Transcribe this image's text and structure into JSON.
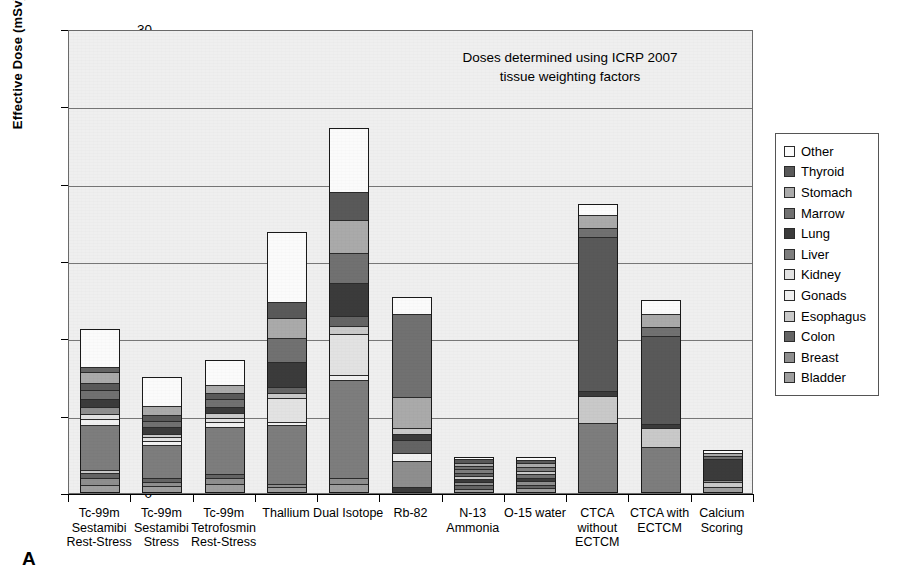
{
  "axis": {
    "ylabel": "Effective Dose (mSv)",
    "yticks": [
      "0",
      "5",
      "10",
      "15",
      "20",
      "25",
      "30"
    ]
  },
  "annotation": {
    "line1": "Doses determined using ICRP 2007",
    "line2": "tissue weighting factors"
  },
  "panel_letter": "A",
  "legend": {
    "items": [
      {
        "label": "Other",
        "color": "#fbfbfb"
      },
      {
        "label": "Thyroid",
        "color": "#595959"
      },
      {
        "label": "Stomach",
        "color": "#aaaaaa"
      },
      {
        "label": "Marrow",
        "color": "#717171"
      },
      {
        "label": "Lung",
        "color": "#3b3b3b"
      },
      {
        "label": "Liver",
        "color": "#7d7d7d"
      },
      {
        "label": "Kidney",
        "color": "#e2e2e2"
      },
      {
        "label": "Gonads",
        "color": "#f0f0f0"
      },
      {
        "label": "Esophagus",
        "color": "#c9c9c9"
      },
      {
        "label": "Colon",
        "color": "#646464"
      },
      {
        "label": "Breast",
        "color": "#8e8e8e"
      },
      {
        "label": "Bladder",
        "color": "#9e9e9e"
      }
    ]
  },
  "chart_data": {
    "type": "bar",
    "stacked": true,
    "title": "",
    "xlabel": "",
    "ylabel": "Effective Dose (mSv)",
    "ylim": [
      0,
      30
    ],
    "ytick_step": 5,
    "grid": true,
    "legend_position": "right",
    "annotation": "Doses determined using ICRP 2007 tissue weighting factors",
    "series_order_bottom_to_top": [
      "Bladder",
      "Breast",
      "Colon",
      "Esophagus",
      "Gonads",
      "Kidney",
      "Liver",
      "Lung",
      "Marrow",
      "Stomach",
      "Thyroid",
      "Other"
    ],
    "categories": [
      "Tc-99m Sestamibi Rest-Stress",
      "Tc-99m Sestamibi Stress",
      "Tc-99m Tetrofosmin Rest-Stress",
      "Thallium",
      "Dual Isotope",
      "Rb-82",
      "N-13 Ammonia",
      "O-15 water",
      "CTCA without ECTCM",
      "CTCA with ECTCM",
      "Calcium Scoring"
    ],
    "category_labels_multiline": [
      "Tc-99m\nSestamibi\nRest-Stress",
      "Tc-99m\nSestamibi\nStress",
      "Tc-99m\nTetrofosmin\nRest-Stress",
      "Thallium",
      "Dual Isotope",
      "Rb-82",
      "N-13\nAmmonia",
      "O-15 water",
      "CTCA\nwithout\nECTCM",
      "CTCA with\nECTCM",
      "Calcium\nScoring"
    ],
    "totals": [
      10.6,
      7.5,
      8.6,
      16.9,
      23.6,
      12.7,
      2.3,
      2.3,
      18.7,
      12.5,
      2.8
    ],
    "series": [
      {
        "name": "Bladder",
        "color": "#9e9e9e",
        "values": [
          0.45,
          0.35,
          0.5,
          0.25,
          0.45,
          0.0,
          0.15,
          0.15,
          0.0,
          0.0,
          0.3
        ]
      },
      {
        "name": "Breast",
        "color": "#8e8e8e",
        "values": [
          0.4,
          0.3,
          0.35,
          0.15,
          0.35,
          0.3,
          0.15,
          0.15,
          0.0,
          0.0,
          0.2
        ]
      },
      {
        "name": "Colon",
        "color": "#646464",
        "values": [
          0.3,
          0.25,
          0.3,
          0.1,
          0.3,
          0.0,
          0.2,
          0.2,
          0.0,
          0.0,
          0.0
        ]
      },
      {
        "name": "Esophagus",
        "color": "#c9c9c9",
        "values": [
          0.1,
          0.1,
          0.1,
          0.1,
          0.15,
          0.4,
          0.15,
          0.15,
          0.0,
          0.0,
          0.2
        ]
      },
      {
        "name": "Gonads",
        "color": "#f0f0f0",
        "values": [
          0.1,
          0.1,
          0.1,
          0.1,
          0.1,
          0.1,
          0.1,
          0.1,
          0.0,
          0.0,
          0.05
        ]
      },
      {
        "name": "Kidney",
        "color": "#e2e2e2",
        "values": [
          0.1,
          0.1,
          0.1,
          0.1,
          0.1,
          0.1,
          0.1,
          0.1,
          0.0,
          0.0,
          0.0
        ]
      },
      {
        "name": "Liver",
        "color": "#7d7d7d",
        "values": [
          3.2,
          2.1,
          3.3,
          3.8,
          5.8,
          0.7,
          0.3,
          0.3,
          4.5,
          2.9,
          0.0
        ]
      },
      {
        "name": "Lung",
        "color": "#3b3b3b",
        "values": [
          0.35,
          0.3,
          0.35,
          0.3,
          0.55,
          0.55,
          0.25,
          0.25,
          0.1,
          0.1,
          1.6
        ]
      },
      {
        "name": "Marrow",
        "color": "#717171",
        "values": [
          0.45,
          0.35,
          0.45,
          2.15,
          1.35,
          0.3,
          0.25,
          0.25,
          0.3,
          0.25,
          0.1
        ]
      },
      {
        "name": "Stomach",
        "color": "#aaaaaa",
        "values": [
          0.65,
          0.45,
          0.55,
          1.15,
          1.3,
          4.65,
          0.2,
          0.2,
          1.55,
          1.1,
          0.1
        ]
      },
      {
        "name": "Thyroid",
        "color": "#595959",
        "values": [
          0.8,
          0.6,
          0.7,
          1.6,
          2.15,
          0.2,
          0.25,
          0.25,
          10.45,
          6.85,
          0.0
        ]
      },
      {
        "name": "Other",
        "color": "#fbfbfb",
        "values": [
          3.7,
          2.5,
          1.8,
          7.1,
          11.0,
          5.4,
          0.3,
          0.3,
          1.8,
          1.3,
          0.25
        ]
      }
    ]
  },
  "bars": [
    {
      "name": "tc99m-sestamibi-rest-stress",
      "label": "Tc-99m\nSestamibi\nRest-Stress",
      "total": 10.6,
      "segments": [
        {
          "tissue": "Bladder",
          "value": 0.45,
          "color": "#9e9e9e"
        },
        {
          "tissue": "Breast",
          "value": 0.4,
          "color": "#8e8e8e"
        },
        {
          "tissue": "Colon",
          "value": 0.3,
          "color": "#646464"
        },
        {
          "tissue": "Esophagus",
          "value": 0.1,
          "color": "#c9c9c9"
        },
        {
          "tissue": "Liver",
          "value": 3.2,
          "color": "#7d7d7d"
        },
        {
          "tissue": "Gonads",
          "value": 0.35,
          "color": "#f0f0f0"
        },
        {
          "tissue": "Kidney",
          "value": 0.25,
          "color": "#e2e2e2"
        },
        {
          "tissue": "Breast",
          "value": 0.4,
          "color": "#8e8e8e"
        },
        {
          "tissue": "Lung",
          "value": 0.55,
          "color": "#3b3b3b"
        },
        {
          "tissue": "Marrow",
          "value": 0.55,
          "color": "#717171"
        },
        {
          "tissue": "Thyroid",
          "value": 0.45,
          "color": "#595959"
        },
        {
          "tissue": "Stomach",
          "value": 0.7,
          "color": "#aaaaaa"
        },
        {
          "tissue": "Colon",
          "value": 0.3,
          "color": "#646464"
        },
        {
          "tissue": "Other",
          "value": 2.6,
          "color": "#fbfbfb"
        }
      ]
    },
    {
      "name": "tc99m-sestamibi-stress",
      "label": "Tc-99m\nSestamibi\nStress",
      "total": 7.5,
      "segments": [
        {
          "tissue": "Bladder",
          "value": 0.35,
          "color": "#9e9e9e"
        },
        {
          "tissue": "Breast",
          "value": 0.25,
          "color": "#8e8e8e"
        },
        {
          "tissue": "Colon",
          "value": 0.2,
          "color": "#646464"
        },
        {
          "tissue": "Liver",
          "value": 2.3,
          "color": "#7d7d7d"
        },
        {
          "tissue": "Gonads",
          "value": 0.25,
          "color": "#f0f0f0"
        },
        {
          "tissue": "Kidney",
          "value": 0.2,
          "color": "#e2e2e2"
        },
        {
          "tissue": "Esophagus",
          "value": 0.2,
          "color": "#c9c9c9"
        },
        {
          "tissue": "Lung",
          "value": 0.4,
          "color": "#3b3b3b"
        },
        {
          "tissue": "Marrow",
          "value": 0.4,
          "color": "#717171"
        },
        {
          "tissue": "Thyroid",
          "value": 0.35,
          "color": "#595959"
        },
        {
          "tissue": "Stomach",
          "value": 0.55,
          "color": "#aaaaaa"
        },
        {
          "tissue": "Other",
          "value": 2.05,
          "color": "#fbfbfb"
        }
      ]
    },
    {
      "name": "tc99m-tetrofosmin-rest-stress",
      "label": "Tc-99m\nTetrofosmin\nRest-Stress",
      "total": 8.6,
      "segments": [
        {
          "tissue": "Bladder",
          "value": 0.5,
          "color": "#9e9e9e"
        },
        {
          "tissue": "Breast",
          "value": 0.35,
          "color": "#8e8e8e"
        },
        {
          "tissue": "Colon",
          "value": 0.25,
          "color": "#646464"
        },
        {
          "tissue": "Liver",
          "value": 3.3,
          "color": "#7d7d7d"
        },
        {
          "tissue": "Gonads",
          "value": 0.25,
          "color": "#f0f0f0"
        },
        {
          "tissue": "Kidney",
          "value": 0.25,
          "color": "#e2e2e2"
        },
        {
          "tissue": "Esophagus",
          "value": 0.25,
          "color": "#c9c9c9"
        },
        {
          "tissue": "Lung",
          "value": 0.4,
          "color": "#3b3b3b"
        },
        {
          "tissue": "Marrow",
          "value": 0.45,
          "color": "#717171"
        },
        {
          "tissue": "Thyroid",
          "value": 0.4,
          "color": "#595959"
        },
        {
          "tissue": "Stomach",
          "value": 0.5,
          "color": "#aaaaaa"
        },
        {
          "tissue": "Other",
          "value": 1.7,
          "color": "#fbfbfb"
        }
      ]
    },
    {
      "name": "thallium",
      "label": "Thallium",
      "total": 16.9,
      "segments": [
        {
          "tissue": "Bladder",
          "value": 0.25,
          "color": "#9e9e9e"
        },
        {
          "tissue": "Breast",
          "value": 0.15,
          "color": "#8e8e8e"
        },
        {
          "tissue": "Liver",
          "value": 3.95,
          "color": "#7d7d7d"
        },
        {
          "tissue": "Gonads",
          "value": 0.15,
          "color": "#f0f0f0"
        },
        {
          "tissue": "Kidney",
          "value": 1.55,
          "color": "#e2e2e2"
        },
        {
          "tissue": "Esophagus",
          "value": 0.3,
          "color": "#c9c9c9"
        },
        {
          "tissue": "Colon",
          "value": 0.35,
          "color": "#646464"
        },
        {
          "tissue": "Lung",
          "value": 1.6,
          "color": "#3b3b3b"
        },
        {
          "tissue": "Marrow",
          "value": 1.55,
          "color": "#717171"
        },
        {
          "tissue": "Stomach",
          "value": 1.3,
          "color": "#aaaaaa"
        },
        {
          "tissue": "Thyroid",
          "value": 1.0,
          "color": "#595959"
        },
        {
          "tissue": "Other",
          "value": 4.75,
          "color": "#fbfbfb"
        }
      ]
    },
    {
      "name": "dual-isotope",
      "label": "Dual Isotope",
      "total": 23.6,
      "segments": [
        {
          "tissue": "Bladder",
          "value": 0.45,
          "color": "#9e9e9e"
        },
        {
          "tissue": "Breast",
          "value": 0.35,
          "color": "#8e8e8e"
        },
        {
          "tissue": "Liver",
          "value": 6.5,
          "color": "#7d7d7d"
        },
        {
          "tissue": "Gonads",
          "value": 0.25,
          "color": "#f0f0f0"
        },
        {
          "tissue": "Kidney",
          "value": 2.7,
          "color": "#e2e2e2"
        },
        {
          "tissue": "Esophagus",
          "value": 0.45,
          "color": "#c9c9c9"
        },
        {
          "tissue": "Colon",
          "value": 0.65,
          "color": "#646464"
        },
        {
          "tissue": "Lung",
          "value": 2.15,
          "color": "#3b3b3b"
        },
        {
          "tissue": "Marrow",
          "value": 1.95,
          "color": "#717171"
        },
        {
          "tissue": "Stomach",
          "value": 2.15,
          "color": "#aaaaaa"
        },
        {
          "tissue": "Thyroid",
          "value": 1.75,
          "color": "#595959"
        },
        {
          "tissue": "Other",
          "value": 4.25,
          "color": "#fbfbfb"
        }
      ]
    },
    {
      "name": "rb-82",
      "label": "Rb-82",
      "total": 12.7,
      "segments": [
        {
          "tissue": "Lung",
          "value": 0.25,
          "color": "#3b3b3b"
        },
        {
          "tissue": "Breast",
          "value": 1.75,
          "color": "#8e8e8e"
        },
        {
          "tissue": "Gonads",
          "value": 0.45,
          "color": "#f0f0f0"
        },
        {
          "tissue": "Colon",
          "value": 0.85,
          "color": "#646464"
        },
        {
          "tissue": "Lung",
          "value": 0.3,
          "color": "#3b3b3b"
        },
        {
          "tissue": "Esophagus",
          "value": 0.35,
          "color": "#c9c9c9"
        },
        {
          "tissue": "Stomach",
          "value": 2.05,
          "color": "#aaaaaa"
        },
        {
          "tissue": "Marrow",
          "value": 5.6,
          "color": "#717171"
        },
        {
          "tissue": "Other",
          "value": 1.1,
          "color": "#fbfbfb"
        }
      ]
    },
    {
      "name": "n-13-ammonia",
      "label": "N-13\nAmmonia",
      "total": 2.3,
      "segments": [
        {
          "tissue": "Bladder",
          "value": 0.22,
          "color": "#9e9e9e"
        },
        {
          "tissue": "Colon",
          "value": 0.22,
          "color": "#646464"
        },
        {
          "tissue": "Breast",
          "value": 0.2,
          "color": "#8e8e8e"
        },
        {
          "tissue": "Lung",
          "value": 0.22,
          "color": "#3b3b3b"
        },
        {
          "tissue": "Esophagus",
          "value": 0.18,
          "color": "#c9c9c9"
        },
        {
          "tissue": "Colon",
          "value": 0.25,
          "color": "#646464"
        },
        {
          "tissue": "Liver",
          "value": 0.25,
          "color": "#7d7d7d"
        },
        {
          "tissue": "Marrow",
          "value": 0.26,
          "color": "#717171"
        },
        {
          "tissue": "Stomach",
          "value": 0.18,
          "color": "#aaaaaa"
        },
        {
          "tissue": "Thyroid",
          "value": 0.22,
          "color": "#595959"
        },
        {
          "tissue": "Other",
          "value": 0.1,
          "color": "#fbfbfb"
        }
      ]
    },
    {
      "name": "o-15-water",
      "label": "O-15 water",
      "total": 2.3,
      "segments": [
        {
          "tissue": "Bladder",
          "value": 0.25,
          "color": "#9e9e9e"
        },
        {
          "tissue": "Colon",
          "value": 0.25,
          "color": "#646464"
        },
        {
          "tissue": "Breast",
          "value": 0.22,
          "color": "#8e8e8e"
        },
        {
          "tissue": "Lung",
          "value": 0.22,
          "color": "#3b3b3b"
        },
        {
          "tissue": "Marrow",
          "value": 0.3,
          "color": "#717171"
        },
        {
          "tissue": "Esophagus",
          "value": 0.18,
          "color": "#c9c9c9"
        },
        {
          "tissue": "Liver",
          "value": 0.3,
          "color": "#7d7d7d"
        },
        {
          "tissue": "Stomach",
          "value": 0.28,
          "color": "#aaaaaa"
        },
        {
          "tissue": "Thyroid",
          "value": 0.2,
          "color": "#595959"
        },
        {
          "tissue": "Other",
          "value": 0.1,
          "color": "#fbfbfb"
        }
      ]
    },
    {
      "name": "ctca-without-ectcm",
      "label": "CTCA\nwithout\nECTCM",
      "total": 18.7,
      "segments": [
        {
          "tissue": "Liver",
          "value": 4.5,
          "color": "#7d7d7d"
        },
        {
          "tissue": "Esophagus",
          "value": 1.75,
          "color": "#c9c9c9"
        },
        {
          "tissue": "Lung",
          "value": 0.25,
          "color": "#3b3b3b"
        },
        {
          "tissue": "Thyroid",
          "value": 10.2,
          "color": "#595959"
        },
        {
          "tissue": "Marrow",
          "value": 0.55,
          "color": "#717171"
        },
        {
          "tissue": "Stomach",
          "value": 0.75,
          "color": "#aaaaaa"
        },
        {
          "tissue": "Other",
          "value": 0.7,
          "color": "#fbfbfb"
        }
      ]
    },
    {
      "name": "ctca-with-ectcm",
      "label": "CTCA with\nECTCM",
      "total": 12.5,
      "segments": [
        {
          "tissue": "Liver",
          "value": 2.95,
          "color": "#7d7d7d"
        },
        {
          "tissue": "Esophagus",
          "value": 1.25,
          "color": "#c9c9c9"
        },
        {
          "tissue": "Lung",
          "value": 0.2,
          "color": "#3b3b3b"
        },
        {
          "tissue": "Thyroid",
          "value": 5.85,
          "color": "#595959"
        },
        {
          "tissue": "Marrow",
          "value": 0.55,
          "color": "#717171"
        },
        {
          "tissue": "Stomach",
          "value": 0.8,
          "color": "#aaaaaa"
        },
        {
          "tissue": "Other",
          "value": 0.9,
          "color": "#fbfbfb"
        }
      ]
    },
    {
      "name": "calcium-scoring",
      "label": "Calcium\nScoring",
      "total": 2.8,
      "segments": [
        {
          "tissue": "Bladder",
          "value": 0.35,
          "color": "#9e9e9e"
        },
        {
          "tissue": "Esophagus",
          "value": 0.25,
          "color": "#c9c9c9"
        },
        {
          "tissue": "Breast",
          "value": 0.15,
          "color": "#8e8e8e"
        },
        {
          "tissue": "Lung",
          "value": 1.55,
          "color": "#3b3b3b"
        },
        {
          "tissue": "Marrow",
          "value": 0.15,
          "color": "#717171"
        },
        {
          "tissue": "Stomach",
          "value": 0.15,
          "color": "#aaaaaa"
        },
        {
          "tissue": "Other",
          "value": 0.2,
          "color": "#fbfbfb"
        }
      ]
    }
  ]
}
